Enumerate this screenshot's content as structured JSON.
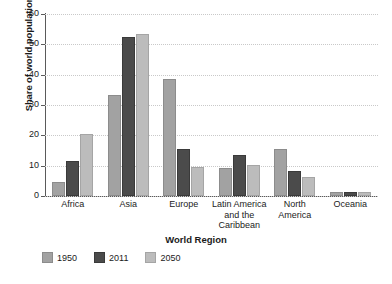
{
  "chart_data": {
    "type": "bar",
    "title": "",
    "xlabel": "World Region",
    "ylabel": "Share of world population (%)",
    "categories": [
      "Africa",
      "Asia",
      "Europe",
      "Latin America and the Caribbean",
      "North America",
      "Oceania"
    ],
    "category_lines": [
      [
        "Africa"
      ],
      [
        "Asia"
      ],
      [
        "Europe"
      ],
      [
        "Latin America",
        "and the",
        "Caribbean"
      ],
      [
        "North",
        "America"
      ],
      [
        "Oceania"
      ]
    ],
    "series": [
      {
        "name": "1950",
        "color": "#a2a2a2",
        "values": [
          4.0,
          32.8,
          37.9,
          8.7,
          14.8,
          0.8
        ]
      },
      {
        "name": "2011",
        "color": "#4b4b4b",
        "values": [
          10.9,
          51.9,
          14.8,
          12.7,
          7.7,
          0.6
        ]
      },
      {
        "name": "2050",
        "color": "#bcbcbc",
        "values": [
          19.9,
          52.9,
          8.9,
          9.6,
          5.6,
          0.5
        ]
      }
    ],
    "ylim": [
      0,
      60
    ],
    "yticks": [
      0,
      10,
      20,
      30,
      40,
      50,
      60
    ],
    "ytick_labels": [
      "0",
      "10",
      "20",
      "30",
      "40",
      "50",
      "60"
    ],
    "grid": true,
    "legend_position": "bottom-left",
    "legend_entries": [
      "1950",
      "2011",
      "2050"
    ]
  },
  "caption_strip": ""
}
